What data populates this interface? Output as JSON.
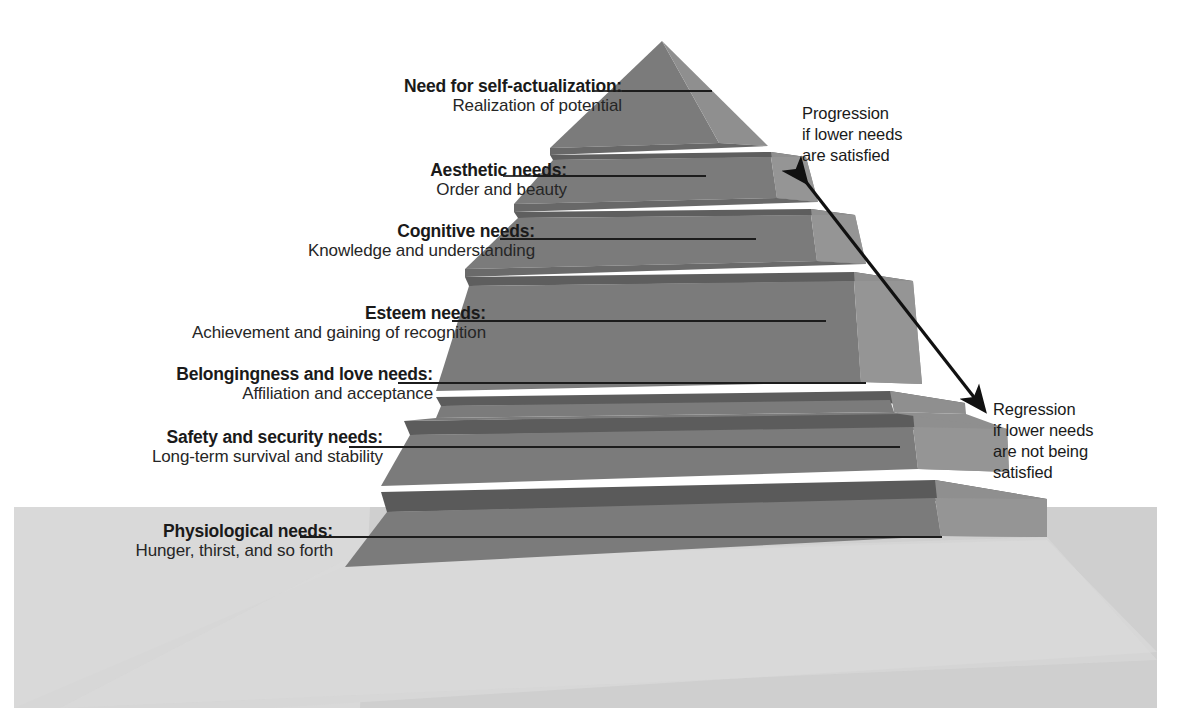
{
  "diagram": {
    "type": "pyramid-hierarchy",
    "background_color": "#ffffff",
    "ground_color": "#cfcfcf",
    "shadow_color": "#dcdcdc",
    "face_front_color": "#7b7b7b",
    "face_right_color": "#8e8e8e",
    "face_top_color": "#5b5b5b",
    "leader_line_color": "#1c1c1c",
    "arrow_color": "#111111"
  },
  "levels": [
    {
      "index": 1,
      "title": "Need for self-actualization:",
      "subtitle": "Realization of potential"
    },
    {
      "index": 2,
      "title": "Aesthetic needs:",
      "subtitle": "Order and beauty"
    },
    {
      "index": 3,
      "title": "Cognitive needs:",
      "subtitle": "Knowledge and understanding"
    },
    {
      "index": 4,
      "title": "Esteem needs:",
      "subtitle": "Achievement and gaining of recognition"
    },
    {
      "index": 5,
      "title": "Belongingness and love needs:",
      "subtitle": "Affiliation and acceptance"
    },
    {
      "index": 6,
      "title": "Safety and security needs:",
      "subtitle": "Long-term survival and stability"
    },
    {
      "index": 7,
      "title": "Physiological needs:",
      "subtitle": "Hunger, thirst, and so forth"
    }
  ],
  "annotations": {
    "progression": "Progression\nif lower needs\nare satisfied",
    "regression": "Regression\nif lower needs\nare not being\nsatisfied"
  }
}
